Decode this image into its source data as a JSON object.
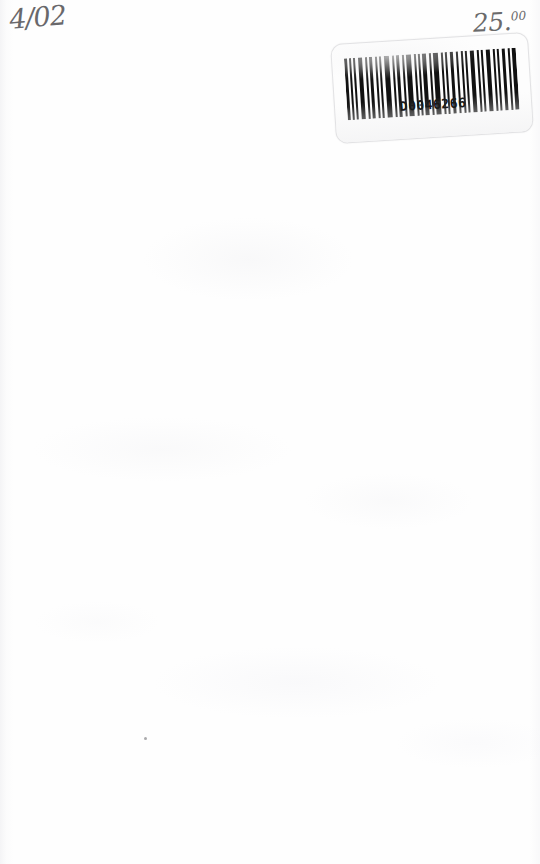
{
  "document": {
    "kind": "scanned-blank-page",
    "page_background_color": "#fefefe"
  },
  "annotations": {
    "date": {
      "text": "4/02",
      "medium": "handwritten-pencil",
      "position": "top-left",
      "color": "#555457"
    },
    "price": {
      "dollars": "25.",
      "cents": "00",
      "full_text": "25.00",
      "medium": "handwritten-pencil",
      "position": "top-right",
      "color": "#5a5a5c"
    }
  },
  "barcode_label": {
    "number": "D0046266",
    "symbology": "code-39",
    "label_background_color": "#fdfdfd",
    "bar_color": "#111111",
    "rotation_degrees": -3.6,
    "bars": [
      {
        "x": 0,
        "w": 3
      },
      {
        "x": 5,
        "w": 2
      },
      {
        "x": 9,
        "w": 2
      },
      {
        "x": 14,
        "w": 4
      },
      {
        "x": 21,
        "w": 2
      },
      {
        "x": 25,
        "w": 3
      },
      {
        "x": 31,
        "w": 2
      },
      {
        "x": 35,
        "w": 2
      },
      {
        "x": 40,
        "w": 5
      },
      {
        "x": 48,
        "w": 2
      },
      {
        "x": 52,
        "w": 3
      },
      {
        "x": 58,
        "w": 2
      },
      {
        "x": 62,
        "w": 5
      },
      {
        "x": 70,
        "w": 2
      },
      {
        "x": 74,
        "w": 2
      },
      {
        "x": 78,
        "w": 4
      },
      {
        "x": 85,
        "w": 2
      },
      {
        "x": 89,
        "w": 5
      },
      {
        "x": 97,
        "w": 2
      },
      {
        "x": 101,
        "w": 2
      },
      {
        "x": 106,
        "w": 3
      },
      {
        "x": 112,
        "w": 2
      },
      {
        "x": 117,
        "w": 2
      },
      {
        "x": 121,
        "w": 2
      },
      {
        "x": 126,
        "w": 4
      },
      {
        "x": 133,
        "w": 2
      },
      {
        "x": 137,
        "w": 2
      },
      {
        "x": 142,
        "w": 4
      },
      {
        "x": 149,
        "w": 2
      },
      {
        "x": 153,
        "w": 2
      },
      {
        "x": 158,
        "w": 3
      },
      {
        "x": 164,
        "w": 2
      },
      {
        "x": 168,
        "w": 4
      }
    ]
  },
  "artifacts": {
    "speck_label": "dust-speck"
  }
}
